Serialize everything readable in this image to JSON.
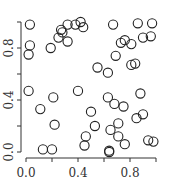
{
  "chart_data": {
    "type": "scatter",
    "title": "",
    "xlabel": "",
    "ylabel": "",
    "xlim": [
      0.0,
      1.0
    ],
    "ylim": [
      0.0,
      1.0
    ],
    "grid": false,
    "legend": null,
    "x_ticks": [
      0.0,
      0.2,
      0.4,
      0.6,
      0.8,
      1.0
    ],
    "x_tick_labels": [
      "0.0",
      "",
      "0.4",
      "",
      "0.8",
      ""
    ],
    "y_ticks": [
      0.0,
      0.2,
      0.4,
      0.6,
      0.8,
      1.0
    ],
    "y_tick_labels": [
      "0.0",
      "",
      "0.4",
      "",
      "0.8",
      ""
    ],
    "marker": "open-circle",
    "marker_color": "#222222",
    "points": [
      [
        0.03,
        0.98
      ],
      [
        0.03,
        0.82
      ],
      [
        0.02,
        0.75
      ],
      [
        0.19,
        0.8
      ],
      [
        0.25,
        0.88
      ],
      [
        0.28,
        0.92
      ],
      [
        0.27,
        0.94
      ],
      [
        0.32,
        0.85
      ],
      [
        0.32,
        0.98
      ],
      [
        0.38,
        0.98
      ],
      [
        0.42,
        1.0
      ],
      [
        0.44,
        0.96
      ],
      [
        0.67,
        0.98
      ],
      [
        0.86,
        0.99
      ],
      [
        0.97,
        0.99
      ],
      [
        0.73,
        0.84
      ],
      [
        0.76,
        0.86
      ],
      [
        0.81,
        0.83
      ],
      [
        0.9,
        0.88
      ],
      [
        0.96,
        0.89
      ],
      [
        0.69,
        0.74
      ],
      [
        0.81,
        0.67
      ],
      [
        0.84,
        0.68
      ],
      [
        0.55,
        0.65
      ],
      [
        0.63,
        0.61
      ],
      [
        0.02,
        0.47
      ],
      [
        0.21,
        0.42
      ],
      [
        0.11,
        0.33
      ],
      [
        0.22,
        0.21
      ],
      [
        0.4,
        0.47
      ],
      [
        0.13,
        0.02
      ],
      [
        0.2,
        0.02
      ],
      [
        0.46,
        0.12
      ],
      [
        0.45,
        0.05
      ],
      [
        0.5,
        0.31
      ],
      [
        0.53,
        0.2
      ],
      [
        0.63,
        0.42
      ],
      [
        0.68,
        0.37
      ],
      [
        0.75,
        0.35
      ],
      [
        0.88,
        0.45
      ],
      [
        0.85,
        0.26
      ],
      [
        0.9,
        0.29
      ],
      [
        0.65,
        0.17
      ],
      [
        0.71,
        0.22
      ],
      [
        0.71,
        0.12
      ],
      [
        0.76,
        0.06
      ],
      [
        0.94,
        0.09
      ],
      [
        0.98,
        0.08
      ],
      [
        0.64,
        0.01
      ],
      [
        0.64,
        0.0
      ]
    ]
  }
}
